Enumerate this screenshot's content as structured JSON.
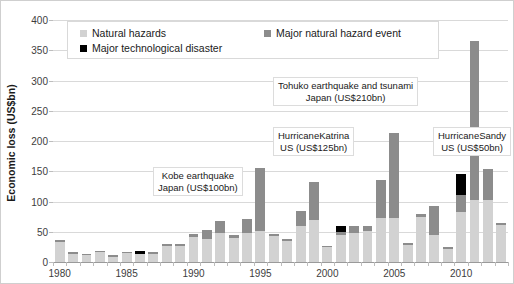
{
  "chart_data": {
    "type": "bar",
    "title": "",
    "subtitle": "",
    "xlabel": "",
    "ylabel": "Economic loss (US$bn)",
    "ylim": [
      0,
      400
    ],
    "ytick_step": 50,
    "yticks": [
      "400",
      "350",
      "300",
      "250",
      "200",
      "150",
      "100",
      "50",
      "0"
    ],
    "grid": true,
    "stacked": true,
    "legend_position": "top-inside",
    "legend": [
      {
        "label": "Natural hazards",
        "color": "#d2d2d2",
        "key": "natural_hazards"
      },
      {
        "label": "Major natural hazard event",
        "color": "#8c8c8c",
        "key": "major_natural_hazard_event"
      },
      {
        "label": "Major technological disaster",
        "color": "#000000",
        "key": "major_technological_disaster"
      }
    ],
    "categories": [
      "1980",
      "1981",
      "1982",
      "1983",
      "1984",
      "1985",
      "1986",
      "1987",
      "1988",
      "1989",
      "1990",
      "1991",
      "1992",
      "1993",
      "1994",
      "1995",
      "1996",
      "1997",
      "1998",
      "1999",
      "2000",
      "2001",
      "2002",
      "2003",
      "2004",
      "2005",
      "2006",
      "2007",
      "2008",
      "2009",
      "2010",
      "2011",
      "2012",
      "2013"
    ],
    "xtick_labels": [
      "1980",
      "1985",
      "1990",
      "1995",
      "2000",
      "2005",
      "2010"
    ],
    "series": [
      {
        "name": "Natural hazards",
        "color": "#d2d2d2",
        "values": [
          33,
          14,
          11,
          17,
          9,
          15,
          14,
          14,
          26,
          26,
          42,
          38,
          48,
          40,
          48,
          52,
          43,
          35,
          60,
          70,
          24,
          45,
          48,
          52,
          72,
          72,
          28,
          75,
          45,
          22,
          82,
          103,
          102,
          62
        ]
      },
      {
        "name": "Major natural hazard event",
        "color": "#8c8c8c",
        "values": [
          4,
          3,
          2,
          2,
          2,
          2,
          0,
          2,
          3,
          3,
          4,
          15,
          20,
          4,
          23,
          103,
          3,
          3,
          25,
          63,
          2,
          4,
          12,
          8,
          64,
          141,
          3,
          4,
          47,
          3,
          28,
          262,
          51,
          3
        ]
      },
      {
        "name": "Major technological disaster",
        "color": "#000000",
        "values": [
          0,
          0,
          0,
          0,
          0,
          0,
          4,
          0,
          0,
          0,
          0,
          0,
          0,
          0,
          0,
          0,
          0,
          0,
          0,
          0,
          0,
          11,
          0,
          0,
          0,
          0,
          0,
          0,
          0,
          0,
          35,
          0,
          0,
          0
        ]
      }
    ],
    "annotations": [
      {
        "id": "kobe",
        "lines": [
          "Kobe earthquake",
          "Japan (US$100bn)"
        ],
        "event_year": "1995",
        "value_label": "US$100bn"
      },
      {
        "id": "katrina",
        "lines": [
          "HurricaneKatrina",
          "US (US$125bn)"
        ],
        "event_year": "2005",
        "value_label": "US$125bn"
      },
      {
        "id": "tohoku",
        "lines": [
          "Tohuko earthquake and tsunami",
          "Japan (US$210bn)"
        ],
        "event_year": "2011",
        "value_label": "US$210bn"
      },
      {
        "id": "sandy",
        "lines": [
          "HurricaneSandy",
          "US (US$50bn)"
        ],
        "event_year": "2012",
        "value_label": "US$50bn"
      }
    ]
  }
}
